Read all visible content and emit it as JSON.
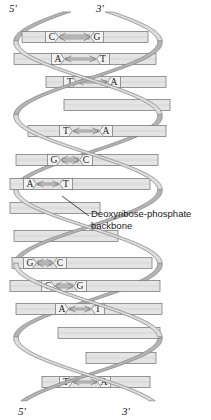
{
  "diagram": {
    "colors": {
      "backbone_fill": "#dcdcdc",
      "backbone_fill_dark": "#b4b4b4",
      "backbone_edge": "#8c8c8c",
      "rung_fill": "#e4e4e4",
      "rung_edge": "#6e6e6e",
      "base_box_fill": "#f2f2f2",
      "text": "#1a1a1a",
      "background": "#ffffff"
    },
    "end_labels": {
      "top_left": "5′",
      "top_right": "3′",
      "bottom_left": "5′",
      "bottom_right": "3′"
    },
    "callout": {
      "line1": "Deoxyribose-phosphate",
      "line2": "backbone"
    },
    "base_pairs": [
      {
        "left": "C",
        "right": "G",
        "bonds": 3,
        "direction": "left",
        "y": 37,
        "x1": 22,
        "x2": 148,
        "bx1": 52,
        "bx2": 97,
        "visible": true
      },
      {
        "left": "A",
        "right": "T",
        "bonds": 2,
        "direction": "right",
        "y": 59,
        "x1": 14,
        "x2": 156,
        "bx1": 58,
        "bx2": 103,
        "visible": true
      },
      {
        "left": "T",
        "right": "A",
        "bonds": 2,
        "direction": "left",
        "y": 82,
        "x1": 46,
        "x2": 166,
        "bx1": 70,
        "bx2": 114,
        "visible": true
      },
      {
        "left": "",
        "right": "",
        "bonds": 0,
        "direction": "none",
        "y": 105,
        "x1": 64,
        "x2": 170,
        "bx1": 0,
        "bx2": 0,
        "visible": false
      },
      {
        "left": "T",
        "right": "A",
        "bonds": 2,
        "direction": "left",
        "y": 131,
        "x1": 28,
        "x2": 166,
        "bx1": 66,
        "bx2": 106,
        "visible": true
      },
      {
        "left": "G",
        "right": "C",
        "bonds": 3,
        "direction": "left",
        "y": 160,
        "x1": 16,
        "x2": 158,
        "bx1": 54,
        "bx2": 86,
        "visible": true
      },
      {
        "left": "A",
        "right": "T",
        "bonds": 2,
        "direction": "right",
        "y": 184,
        "x1": 10,
        "x2": 150,
        "bx1": 30,
        "bx2": 66,
        "visible": true
      },
      {
        "left": "",
        "right": "",
        "bonds": 0,
        "direction": "none",
        "y": 208,
        "x1": 10,
        "x2": 100,
        "bx1": 0,
        "bx2": 0,
        "visible": false
      },
      {
        "left": "",
        "right": "",
        "bonds": 0,
        "direction": "none",
        "y": 236,
        "x1": 14,
        "x2": 118,
        "bx1": 0,
        "bx2": 0,
        "visible": false
      },
      {
        "left": "G",
        "right": "C",
        "bonds": 3,
        "direction": "right",
        "y": 263,
        "x1": 12,
        "x2": 152,
        "bx1": 30,
        "bx2": 60,
        "visible": true
      },
      {
        "left": "C",
        "right": "G",
        "bonds": 3,
        "direction": "left",
        "y": 286,
        "x1": 10,
        "x2": 160,
        "bx1": 48,
        "bx2": 80,
        "visible": true
      },
      {
        "left": "A",
        "right": "T",
        "bonds": 2,
        "direction": "right",
        "y": 309,
        "x1": 16,
        "x2": 162,
        "bx1": 62,
        "bx2": 98,
        "visible": true
      },
      {
        "left": "",
        "right": "",
        "bonds": 0,
        "direction": "none",
        "y": 333,
        "x1": 58,
        "x2": 160,
        "bx1": 0,
        "bx2": 0,
        "visible": false
      },
      {
        "left": "",
        "right": "",
        "bonds": 0,
        "direction": "none",
        "y": 358,
        "x1": 86,
        "x2": 156,
        "bx1": 0,
        "bx2": 0,
        "visible": false
      },
      {
        "left": "T",
        "right": "A",
        "bonds": 2,
        "direction": "left",
        "y": 382,
        "x1": 42,
        "x2": 150,
        "bx1": 66,
        "bx2": 104,
        "visible": true
      }
    ],
    "strands": [
      {
        "name": "strand-left",
        "five_prime_end": "top",
        "three_prime_end": "bottom"
      },
      {
        "name": "strand-right",
        "five_prime_end": "bottom",
        "three_prime_end": "top"
      }
    ]
  }
}
